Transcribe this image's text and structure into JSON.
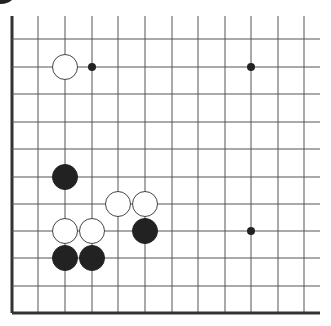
{
  "board": {
    "description": "Go board fragment (lower-left corner region)",
    "colors": {
      "background": "#ffffff",
      "line": "#555555",
      "edge": "#333333",
      "black_stone": "#222222",
      "white_stone": "#ffffff",
      "white_stone_outline": "#444444",
      "star_point": "#222222"
    },
    "x_lines": [
      12,
      38,
      65,
      92,
      118,
      145,
      172,
      198,
      225,
      251,
      278,
      304
    ],
    "y_lines": [
      39,
      67,
      94,
      122,
      149,
      177,
      204,
      231,
      258,
      286,
      313
    ],
    "line_x_end": 320,
    "line_y_start": 16,
    "stone_radius": 12.5,
    "star_points": [
      {
        "col": 3,
        "row": 1
      },
      {
        "col": 9,
        "row": 1
      },
      {
        "col": 9,
        "row": 7
      }
    ],
    "stones": [
      {
        "color": "white",
        "col": 2,
        "row": 1
      },
      {
        "color": "black",
        "col": 2,
        "row": 5
      },
      {
        "color": "white",
        "col": 4,
        "row": 6
      },
      {
        "color": "white",
        "col": 5,
        "row": 6
      },
      {
        "color": "black",
        "col": 5,
        "row": 7
      },
      {
        "color": "white",
        "col": 2,
        "row": 7
      },
      {
        "color": "white",
        "col": 3,
        "row": 7
      },
      {
        "color": "black",
        "col": 2,
        "row": 8
      },
      {
        "color": "black",
        "col": 3,
        "row": 8
      }
    ]
  }
}
